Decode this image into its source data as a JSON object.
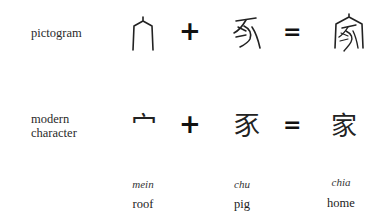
{
  "rows": {
    "pictogram": {
      "label": "pictogram",
      "glyphs": [
        "roof-pictogram",
        "pig-pictogram",
        "home-pictogram"
      ]
    },
    "modern": {
      "label_line1": "modern",
      "label_line2": "character",
      "chars": [
        "宀",
        "豕",
        "家"
      ]
    }
  },
  "operators": {
    "plus": "+",
    "equals": "="
  },
  "columns": [
    {
      "romanization": "mein",
      "meaning": "roof"
    },
    {
      "romanization": "chu",
      "meaning": "pig"
    },
    {
      "romanization": "chia",
      "meaning": "home"
    }
  ]
}
